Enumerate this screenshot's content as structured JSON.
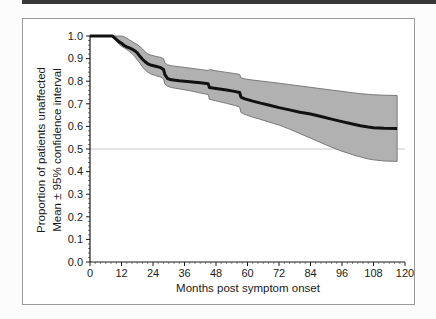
{
  "figure": {
    "top_rule": "decorative horizontal rule",
    "frame": "single gray border box around chart"
  },
  "chart_data": {
    "type": "line",
    "subtype": "kaplan-meier survival curve with 95% confidence band",
    "title": "",
    "xlabel": "Months post symptom onset",
    "ylabel_line1": "Proportion of patients unaffected",
    "ylabel_line2": "Mean ± 95% confidence interval",
    "xlim": [
      0,
      120
    ],
    "ylim": [
      0,
      1
    ],
    "xticks": [
      0,
      12,
      24,
      36,
      48,
      60,
      72,
      84,
      96,
      108,
      120
    ],
    "yticks": [
      "0.0",
      "0.1",
      "0.2",
      "0.3",
      "0.4",
      "0.5",
      "0.6",
      "0.7",
      "0.8",
      "0.9",
      "1.0"
    ],
    "x_minor_step": 2,
    "y_minor_step": 0.02,
    "reference_line_y": 0.5,
    "grid": "off",
    "legend": "none",
    "series": [
      {
        "name": "mean",
        "x": [
          0,
          8.5,
          10,
          11,
          12,
          13,
          14,
          15,
          16,
          17,
          18,
          19,
          20,
          21,
          22,
          23,
          25,
          27,
          28,
          28.5,
          29.5,
          31,
          34,
          38,
          42,
          45,
          45.5,
          48,
          52,
          55,
          57,
          57.5,
          59,
          62,
          65,
          68,
          72,
          76,
          80,
          84,
          88,
          92,
          96,
          100,
          103,
          106,
          108,
          112,
          117
        ],
        "y": [
          1.0,
          1.0,
          0.985,
          0.975,
          0.968,
          0.958,
          0.952,
          0.947,
          0.942,
          0.935,
          0.925,
          0.91,
          0.897,
          0.886,
          0.877,
          0.872,
          0.866,
          0.86,
          0.852,
          0.83,
          0.812,
          0.806,
          0.802,
          0.798,
          0.793,
          0.789,
          0.772,
          0.768,
          0.761,
          0.755,
          0.75,
          0.73,
          0.722,
          0.712,
          0.703,
          0.695,
          0.683,
          0.673,
          0.663,
          0.655,
          0.644,
          0.632,
          0.621,
          0.611,
          0.603,
          0.597,
          0.594,
          0.592,
          0.591
        ]
      },
      {
        "name": "upper_95ci",
        "x": [
          0,
          8.5,
          12,
          13,
          14,
          15,
          16,
          17,
          18,
          19,
          20,
          21,
          22,
          23,
          25,
          27,
          28,
          28.5,
          29.5,
          31,
          34,
          38,
          42,
          45,
          45.5,
          48,
          52,
          55,
          57,
          57.5,
          59,
          62,
          65,
          68,
          72,
          76,
          80,
          84,
          88,
          92,
          96,
          100,
          103,
          106,
          108,
          112,
          117
        ],
        "y": [
          1.0,
          1.0,
          1.0,
          0.997,
          0.99,
          0.983,
          0.976,
          0.968,
          0.962,
          0.953,
          0.943,
          0.93,
          0.921,
          0.916,
          0.91,
          0.905,
          0.9,
          0.882,
          0.873,
          0.868,
          0.864,
          0.858,
          0.852,
          0.847,
          0.852,
          0.846,
          0.839,
          0.834,
          0.83,
          0.815,
          0.81,
          0.805,
          0.801,
          0.797,
          0.791,
          0.785,
          0.779,
          0.773,
          0.767,
          0.761,
          0.755,
          0.749,
          0.745,
          0.742,
          0.74,
          0.738,
          0.737
        ]
      },
      {
        "name": "lower_95ci",
        "x": [
          0,
          8.5,
          10,
          11,
          12,
          13,
          14,
          15,
          16,
          17,
          18,
          19,
          20,
          21,
          22,
          23,
          25,
          27,
          28,
          28.5,
          29.5,
          31,
          34,
          38,
          42,
          45,
          45.5,
          48,
          52,
          55,
          57,
          57.5,
          59,
          62,
          65,
          68,
          72,
          76,
          80,
          84,
          88,
          92,
          96,
          100,
          103,
          106,
          108,
          112,
          117
        ],
        "y": [
          1.0,
          1.0,
          0.978,
          0.964,
          0.955,
          0.948,
          0.94,
          0.932,
          0.922,
          0.91,
          0.895,
          0.88,
          0.863,
          0.85,
          0.84,
          0.833,
          0.825,
          0.818,
          0.81,
          0.788,
          0.778,
          0.772,
          0.766,
          0.758,
          0.748,
          0.741,
          0.72,
          0.713,
          0.702,
          0.693,
          0.686,
          0.662,
          0.653,
          0.641,
          0.631,
          0.62,
          0.606,
          0.588,
          0.568,
          0.548,
          0.528,
          0.508,
          0.49,
          0.475,
          0.465,
          0.456,
          0.452,
          0.447,
          0.445
        ]
      }
    ],
    "colors": {
      "mean_line": "#111111",
      "band_fill": "#b1b1b1",
      "band_edge": "#6f6f6f",
      "reference_line": "#c9c9c9",
      "axis": "#1a1a1a",
      "tick_label": "#1a1a1a",
      "frame_border": "#9a9a9a",
      "top_rule": "#383838"
    }
  }
}
